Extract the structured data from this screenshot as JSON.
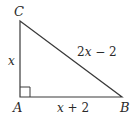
{
  "diagram": {
    "type": "right-triangle",
    "vertices": {
      "A": {
        "label": "A",
        "x": 20,
        "y": 97
      },
      "B": {
        "label": "B",
        "x": 122,
        "y": 97
      },
      "C": {
        "label": "C",
        "x": 20,
        "y": 21
      }
    },
    "right_angle_at": "A",
    "sides": {
      "AC": {
        "label_var": "x",
        "label_rest": ""
      },
      "AB": {
        "label_var": "x",
        "label_rest": " + 2"
      },
      "BC": {
        "label_pre": "2",
        "label_var": "x",
        "label_rest": " − 2"
      }
    },
    "stroke_color": "#3a3a3a"
  }
}
